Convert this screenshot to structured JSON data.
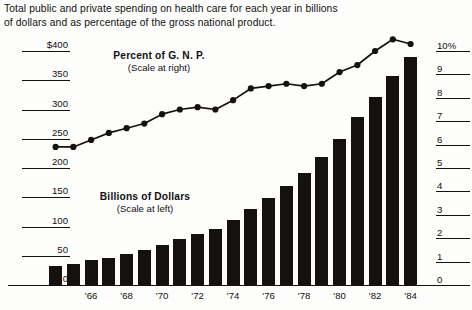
{
  "title": "Total public and private spending on health care for each year in billions of dollars and as percentage of the gross national product.",
  "legends": {
    "gnp": {
      "line1": "Percent of G. N. P.",
      "line2": "(Scale at right)"
    },
    "dollars": {
      "line1": "Billions of Dollars",
      "line2": "(Scale at left)"
    }
  },
  "colors": {
    "ink": "#15110f",
    "paper": "#fdfdfb"
  },
  "chart_data": {
    "type": "bar",
    "title": "Total public and private spending on health care for each year in billions of dollars and as percentage of the gross national product.",
    "xlabel": "",
    "ylabel": "Billions of Dollars",
    "y2label": "Percent of G. N. P.",
    "grid": true,
    "legend_position": "inside",
    "ylim": [
      0,
      400
    ],
    "y2lim": [
      0,
      10
    ],
    "yticks": [
      "0",
      "50",
      "100",
      "150",
      "200",
      "250",
      "300",
      "350",
      "$400"
    ],
    "ytick_values": [
      0,
      50,
      100,
      150,
      200,
      250,
      300,
      350,
      400
    ],
    "y2ticks": [
      "0",
      "1",
      "2",
      "3",
      "4",
      "5",
      "6",
      "7",
      "8",
      "9",
      "10%"
    ],
    "y2tick_values": [
      0,
      1,
      2,
      3,
      4,
      5,
      6,
      7,
      8,
      9,
      10
    ],
    "categories": [
      "1964",
      "1965",
      "1966",
      "1967",
      "1968",
      "1969",
      "1970",
      "1971",
      "1972",
      "1973",
      "1974",
      "1975",
      "1976",
      "1977",
      "1978",
      "1979",
      "1980",
      "1981",
      "1982",
      "1983",
      "1984"
    ],
    "xtick_labels": [
      "'66",
      "'68",
      "'70",
      "'72",
      "'74",
      "'76",
      "'78",
      "'80",
      "'82",
      "'84"
    ],
    "xtick_categories": [
      "1966",
      "1968",
      "1970",
      "1972",
      "1974",
      "1976",
      "1978",
      "1980",
      "1982",
      "1984"
    ],
    "series": [
      {
        "name": "Billions of Dollars",
        "type": "bar",
        "axis": "left",
        "unit": "billions of dollars",
        "values": [
          33,
          36,
          42,
          47,
          53,
          60,
          69,
          78,
          87,
          96,
          111,
          130,
          148,
          170,
          191,
          218,
          250,
          288,
          322,
          357,
          390
        ]
      },
      {
        "name": "Percent of G. N. P.",
        "type": "line",
        "axis": "right",
        "unit": "percent",
        "values": [
          5.9,
          5.9,
          6.2,
          6.5,
          6.7,
          6.9,
          7.3,
          7.5,
          7.6,
          7.5,
          7.9,
          8.4,
          8.5,
          8.6,
          8.5,
          8.6,
          9.1,
          9.4,
          10.0,
          10.5,
          10.3
        ]
      }
    ]
  }
}
